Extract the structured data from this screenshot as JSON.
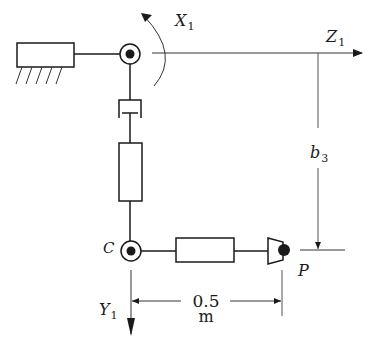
{
  "diagram": {
    "type": "robot-manipulator-kinematic-schematic",
    "colors": {
      "line": "#1a1a1a",
      "thin_line": "#555555",
      "background": "#ffffff"
    },
    "labels": {
      "x_axis": {
        "main": "X",
        "sub": "1"
      },
      "z_axis": {
        "main": "Z",
        "sub": "1"
      },
      "y_axis": {
        "main": "Y",
        "sub": "1"
      },
      "joint_c": "C",
      "point_p": "P",
      "offset": {
        "main": "b",
        "sub": "3"
      },
      "length_value": "0.5",
      "length_unit": "m"
    },
    "components": [
      {
        "name": "fixed-base",
        "kind": "ground"
      },
      {
        "name": "revolute-joint-top",
        "kind": "revolute"
      },
      {
        "name": "prismatic-joint",
        "kind": "prismatic"
      },
      {
        "name": "vertical-link",
        "kind": "link"
      },
      {
        "name": "revolute-joint-c",
        "kind": "revolute"
      },
      {
        "name": "horizontal-link",
        "kind": "link"
      },
      {
        "name": "end-effector",
        "kind": "gripper"
      }
    ]
  }
}
